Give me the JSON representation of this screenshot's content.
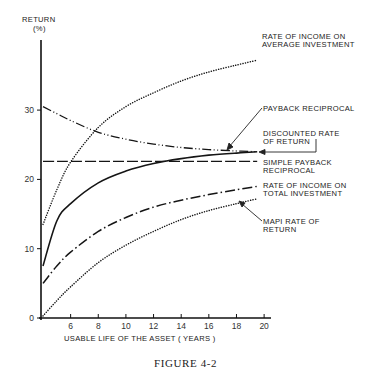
{
  "figure": {
    "caption": "FIGURE 4-2",
    "y_title_line1": "RETURN",
    "y_title_line2": "(%)",
    "x_title": "USABLE LIFE OF THE ASSET   ( YEARS )"
  },
  "axes": {
    "y_ticks": [
      {
        "value": 0,
        "label": "0"
      },
      {
        "value": 10,
        "label": "10"
      },
      {
        "value": 20,
        "label": "20"
      },
      {
        "value": 30,
        "label": "30"
      }
    ],
    "x_ticks": [
      {
        "value": 6,
        "label": "6"
      },
      {
        "value": 8,
        "label": "8"
      },
      {
        "value": 10,
        "label": "10"
      },
      {
        "value": 12,
        "label": "12"
      },
      {
        "value": 14,
        "label": "14"
      },
      {
        "value": 16,
        "label": "16"
      },
      {
        "value": 18,
        "label": "18"
      },
      {
        "value": 20,
        "label": "20"
      }
    ]
  },
  "labels": {
    "avg_investment_1": "RATE OF INCOME ON",
    "avg_investment_2": "AVERAGE INVESTMENT",
    "payback": "PAYBACK RECIPROCAL",
    "discounted_1": "DISCOUNTED RATE",
    "discounted_2": "OF RETURN",
    "simple_payback_1": "SIMPLE PAYBACK",
    "simple_payback_2": "RECIPROCAL",
    "total_investment_1": "RATE OF INCOME ON",
    "total_investment_2": "TOTAL INVESTMENT",
    "mapi_1": "MAPI  RATE OF",
    "mapi_2": "RETURN"
  },
  "chart_data": {
    "type": "line",
    "title": "FIGURE 4-2",
    "xlabel": "USABLE LIFE OF THE ASSET (YEARS)",
    "ylabel": "RETURN (%)",
    "xlim": [
      4,
      21
    ],
    "ylim": [
      0,
      38
    ],
    "grid": false,
    "legend_position": "inline labels at right",
    "x": [
      4,
      5,
      6,
      8,
      10,
      12,
      14,
      16,
      18,
      19.5
    ],
    "series": [
      {
        "name": "Rate of income on average investment",
        "style": "dotted",
        "values": [
          13.5,
          18.5,
          22.5,
          27.5,
          30.5,
          32.5,
          34.2,
          35.5,
          36.5,
          37.2
        ]
      },
      {
        "name": "Payback reciprocal",
        "style": "dash-dot-dot",
        "values": [
          30.5,
          29.5,
          28.5,
          26.8,
          25.8,
          25.1,
          24.6,
          24.3,
          24.1,
          24.0
        ]
      },
      {
        "name": "Discounted rate of return",
        "style": "solid",
        "values": [
          7.5,
          14.0,
          16.5,
          19.5,
          21.2,
          22.3,
          23.0,
          23.5,
          23.8,
          24.0
        ]
      },
      {
        "name": "Simple payback reciprocal",
        "style": "long-dash",
        "values": [
          22.6,
          22.6,
          22.6,
          22.6,
          22.6,
          22.6,
          22.6,
          22.6,
          22.6,
          22.6
        ]
      },
      {
        "name": "Rate of income on total investment",
        "style": "dash-dot",
        "values": [
          5.0,
          7.5,
          9.5,
          12.5,
          14.5,
          16.0,
          17.0,
          17.8,
          18.5,
          19.0
        ]
      },
      {
        "name": "MAPI rate of return",
        "style": "dotted",
        "values": [
          0.3,
          2.5,
          4.5,
          8.0,
          10.5,
          12.5,
          14.2,
          15.5,
          16.5,
          17.2
        ]
      }
    ]
  }
}
